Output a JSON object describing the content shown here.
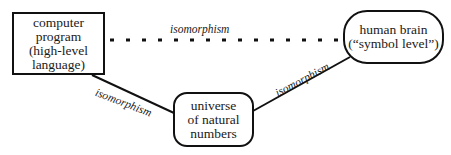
{
  "diagram": {
    "nodes": {
      "program": {
        "lines": [
          "computer",
          "program",
          "(high-level",
          "language)"
        ],
        "shape": "rectangle"
      },
      "brain": {
        "lines": [
          "human brain",
          "(“symbol level”)"
        ],
        "shape": "rounded"
      },
      "numbers": {
        "lines": [
          "universe",
          "of natural",
          "numbers"
        ],
        "shape": "rounded"
      }
    },
    "edges": {
      "program_brain": {
        "label": "isomorphism",
        "style": "dotted"
      },
      "program_numbers": {
        "label": "isomorphism",
        "style": "solid"
      },
      "numbers_brain": {
        "label": "isomorphism",
        "style": "solid"
      }
    },
    "colors": {
      "ink": "#111111",
      "background": "#ffffff"
    }
  }
}
